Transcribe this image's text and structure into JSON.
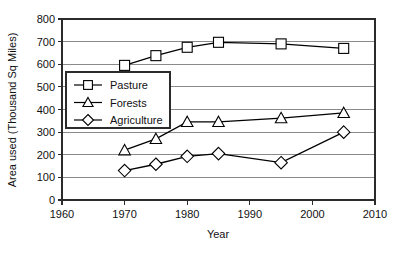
{
  "chart_data": {
    "type": "line",
    "title": "",
    "xlabel": "Year",
    "ylabel": "Area used (Thousand Sq Miles)",
    "xlim": [
      1960,
      2010
    ],
    "ylim": [
      0,
      800
    ],
    "xticks": [
      1960,
      1970,
      1980,
      1990,
      2000,
      2010
    ],
    "yticks": [
      0,
      100,
      200,
      300,
      400,
      500,
      600,
      700,
      800
    ],
    "xtick_labels": [
      "1960",
      "1970",
      "1980",
      "1990",
      "2000",
      "2010"
    ],
    "ytick_labels": [
      "0",
      "100",
      "200",
      "300",
      "400",
      "500",
      "600",
      "700",
      "800"
    ],
    "grid": true,
    "legend_position": "upper-left-inside",
    "x": [
      1970,
      1975,
      1980,
      1985,
      1995,
      2005
    ],
    "series": [
      {
        "name": "Pasture",
        "marker": "square",
        "values": [
          595,
          638,
          675,
          697,
          690,
          670
        ]
      },
      {
        "name": "Forests",
        "marker": "triangle",
        "values": [
          220,
          270,
          345,
          345,
          362,
          385
        ]
      },
      {
        "name": "Agriculture",
        "marker": "diamond",
        "values": [
          130,
          158,
          193,
          205,
          165,
          300
        ]
      }
    ]
  },
  "legend": {
    "items": [
      {
        "label": "Pasture"
      },
      {
        "label": "Forests"
      },
      {
        "label": "Agriculture"
      }
    ]
  },
  "axes": {
    "x_title": "Year",
    "y_title": "Area used (Thousand Sq Miles)"
  }
}
